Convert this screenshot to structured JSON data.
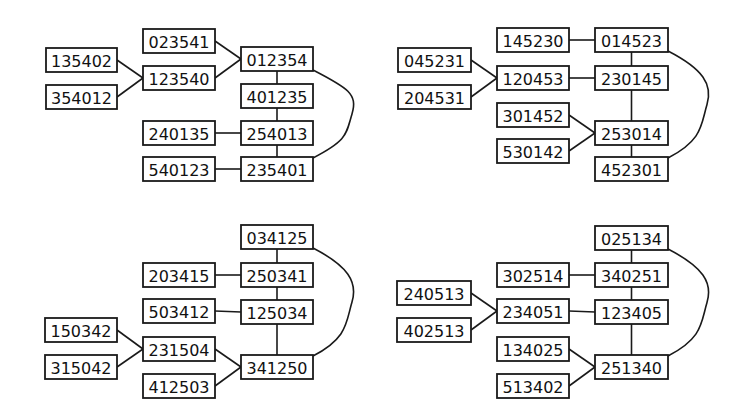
{
  "diagrams": [
    {
      "id": "top-left",
      "nodes": [
        {
          "id": "023541",
          "label": "023541",
          "x": 143,
          "y": 29,
          "w": 72,
          "h": 24
        },
        {
          "id": "012354",
          "label": "012354",
          "x": 241,
          "y": 47,
          "w": 72,
          "h": 24
        },
        {
          "id": "135402",
          "label": "135402",
          "x": 46,
          "y": 48,
          "w": 71,
          "h": 24
        },
        {
          "id": "123540",
          "label": "123540",
          "x": 143,
          "y": 66,
          "w": 72,
          "h": 24
        },
        {
          "id": "354012",
          "label": "354012",
          "x": 46,
          "y": 85,
          "w": 71,
          "h": 24
        },
        {
          "id": "401235",
          "label": "401235",
          "x": 241,
          "y": 84,
          "w": 72,
          "h": 24
        },
        {
          "id": "240135",
          "label": "240135",
          "x": 143,
          "y": 121,
          "w": 72,
          "h": 24
        },
        {
          "id": "254013",
          "label": "254013",
          "x": 241,
          "y": 121,
          "w": 72,
          "h": 24
        },
        {
          "id": "540123",
          "label": "540123",
          "x": 143,
          "y": 157,
          "w": 72,
          "h": 24
        },
        {
          "id": "235401",
          "label": "235401",
          "x": 241,
          "y": 157,
          "w": 72,
          "h": 24
        }
      ],
      "edges": [
        {
          "from": "135402",
          "to": "123540",
          "type": "line"
        },
        {
          "from": "354012",
          "to": "123540",
          "type": "line"
        },
        {
          "from": "023541",
          "to": "012354",
          "type": "line"
        },
        {
          "from": "123540",
          "to": "012354",
          "type": "line"
        },
        {
          "from": "012354",
          "to": "401235",
          "type": "line"
        },
        {
          "from": "401235",
          "to": "254013",
          "type": "line"
        },
        {
          "from": "240135",
          "to": "254013",
          "type": "line"
        },
        {
          "from": "254013",
          "to": "235401",
          "type": "line"
        },
        {
          "from": "540123",
          "to": "235401",
          "type": "line"
        },
        {
          "from": "012354",
          "to": "235401",
          "type": "curve",
          "bulge_x": 352
        }
      ]
    },
    {
      "id": "top-right",
      "nodes": [
        {
          "id": "145230",
          "label": "145230",
          "x": 497,
          "y": 28,
          "w": 72,
          "h": 24
        },
        {
          "id": "014523",
          "label": "014523",
          "x": 595,
          "y": 28,
          "w": 73,
          "h": 24
        },
        {
          "id": "045231",
          "label": "045231",
          "x": 398,
          "y": 48,
          "w": 73,
          "h": 24
        },
        {
          "id": "120453",
          "label": "120453",
          "x": 497,
          "y": 66,
          "w": 72,
          "h": 24
        },
        {
          "id": "230145",
          "label": "230145",
          "x": 595,
          "y": 66,
          "w": 73,
          "h": 24
        },
        {
          "id": "204531",
          "label": "204531",
          "x": 398,
          "y": 85,
          "w": 73,
          "h": 24
        },
        {
          "id": "301452",
          "label": "301452",
          "x": 497,
          "y": 103,
          "w": 72,
          "h": 24
        },
        {
          "id": "253014",
          "label": "253014",
          "x": 595,
          "y": 121,
          "w": 73,
          "h": 24
        },
        {
          "id": "530142",
          "label": "530142",
          "x": 497,
          "y": 139,
          "w": 72,
          "h": 24
        },
        {
          "id": "452301",
          "label": "452301",
          "x": 595,
          "y": 157,
          "w": 73,
          "h": 24
        }
      ],
      "edges": [
        {
          "from": "145230",
          "to": "014523",
          "type": "line"
        },
        {
          "from": "045231",
          "to": "120453",
          "type": "line"
        },
        {
          "from": "204531",
          "to": "120453",
          "type": "line"
        },
        {
          "from": "120453",
          "to": "230145",
          "type": "line"
        },
        {
          "from": "014523",
          "to": "230145",
          "type": "line"
        },
        {
          "from": "230145",
          "to": "253014",
          "type": "line"
        },
        {
          "from": "301452",
          "to": "253014",
          "type": "line"
        },
        {
          "from": "530142",
          "to": "253014",
          "type": "line"
        },
        {
          "from": "253014",
          "to": "452301",
          "type": "line"
        },
        {
          "from": "014523",
          "to": "452301",
          "type": "curve",
          "bulge_x": 707
        }
      ]
    },
    {
      "id": "bottom-left",
      "nodes": [
        {
          "id": "034125",
          "label": "034125",
          "x": 241,
          "y": 225,
          "w": 72,
          "h": 24
        },
        {
          "id": "203415",
          "label": "203415",
          "x": 143,
          "y": 263,
          "w": 72,
          "h": 24
        },
        {
          "id": "250341",
          "label": "250341",
          "x": 241,
          "y": 263,
          "w": 72,
          "h": 24
        },
        {
          "id": "503412",
          "label": "503412",
          "x": 143,
          "y": 299,
          "w": 72,
          "h": 24
        },
        {
          "id": "125034",
          "label": "125034",
          "x": 241,
          "y": 300,
          "w": 72,
          "h": 24
        },
        {
          "id": "150342",
          "label": "150342",
          "x": 45,
          "y": 318,
          "w": 72,
          "h": 24
        },
        {
          "id": "231504",
          "label": "231504",
          "x": 143,
          "y": 337,
          "w": 72,
          "h": 24
        },
        {
          "id": "315042",
          "label": "315042",
          "x": 45,
          "y": 355,
          "w": 72,
          "h": 24
        },
        {
          "id": "341250",
          "label": "341250",
          "x": 241,
          "y": 355,
          "w": 72,
          "h": 24
        },
        {
          "id": "412503",
          "label": "412503",
          "x": 143,
          "y": 374,
          "w": 72,
          "h": 24
        }
      ],
      "edges": [
        {
          "from": "034125",
          "to": "250341",
          "type": "line"
        },
        {
          "from": "203415",
          "to": "250341",
          "type": "line"
        },
        {
          "from": "250341",
          "to": "125034",
          "type": "line"
        },
        {
          "from": "503412",
          "to": "125034",
          "type": "line"
        },
        {
          "from": "125034",
          "to": "341250",
          "type": "line"
        },
        {
          "from": "150342",
          "to": "231504",
          "type": "line"
        },
        {
          "from": "315042",
          "to": "231504",
          "type": "line"
        },
        {
          "from": "231504",
          "to": "341250",
          "type": "line"
        },
        {
          "from": "412503",
          "to": "341250",
          "type": "line"
        },
        {
          "from": "034125",
          "to": "341250",
          "type": "curve",
          "bulge_x": 352
        }
      ]
    },
    {
      "id": "bottom-right",
      "nodes": [
        {
          "id": "025134",
          "label": "025134",
          "x": 595,
          "y": 226,
          "w": 73,
          "h": 24
        },
        {
          "id": "302514",
          "label": "302514",
          "x": 497,
          "y": 263,
          "w": 72,
          "h": 24
        },
        {
          "id": "340251",
          "label": "340251",
          "x": 595,
          "y": 263,
          "w": 73,
          "h": 24
        },
        {
          "id": "240513",
          "label": "240513",
          "x": 397,
          "y": 281,
          "w": 74,
          "h": 24
        },
        {
          "id": "234051",
          "label": "234051",
          "x": 497,
          "y": 299,
          "w": 72,
          "h": 24
        },
        {
          "id": "123405",
          "label": "123405",
          "x": 595,
          "y": 300,
          "w": 73,
          "h": 24
        },
        {
          "id": "402513",
          "label": "402513",
          "x": 397,
          "y": 318,
          "w": 74,
          "h": 24
        },
        {
          "id": "134025",
          "label": "134025",
          "x": 497,
          "y": 337,
          "w": 72,
          "h": 24
        },
        {
          "id": "251340",
          "label": "251340",
          "x": 595,
          "y": 355,
          "w": 73,
          "h": 24
        },
        {
          "id": "513402",
          "label": "513402",
          "x": 497,
          "y": 374,
          "w": 72,
          "h": 24
        }
      ],
      "edges": [
        {
          "from": "025134",
          "to": "340251",
          "type": "line"
        },
        {
          "from": "302514",
          "to": "340251",
          "type": "line"
        },
        {
          "from": "340251",
          "to": "123405",
          "type": "line"
        },
        {
          "from": "240513",
          "to": "234051",
          "type": "line"
        },
        {
          "from": "402513",
          "to": "234051",
          "type": "line"
        },
        {
          "from": "234051",
          "to": "123405",
          "type": "line"
        },
        {
          "from": "123405",
          "to": "251340",
          "type": "line"
        },
        {
          "from": "134025",
          "to": "251340",
          "type": "line"
        },
        {
          "from": "513402",
          "to": "251340",
          "type": "line"
        },
        {
          "from": "025134",
          "to": "251340",
          "type": "curve",
          "bulge_x": 707
        }
      ]
    }
  ],
  "colors": {
    "stroke": "#1a1a1a",
    "box_fill": "#ffffff",
    "text": "#111111",
    "background": "#ffffff"
  }
}
